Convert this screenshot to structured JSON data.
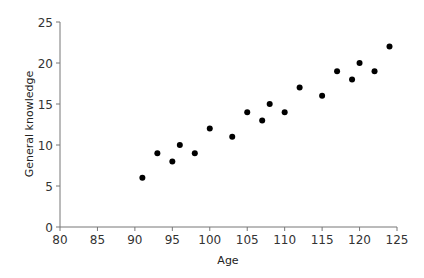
{
  "chart_data": {
    "type": "scatter",
    "title": "",
    "xlabel": "Age",
    "ylabel": "General knowledge",
    "xlim": [
      80,
      125
    ],
    "ylim": [
      0,
      25
    ],
    "xticks": [
      80,
      85,
      90,
      95,
      100,
      105,
      110,
      115,
      120,
      125
    ],
    "yticks": [
      0,
      5,
      10,
      15,
      20,
      25
    ],
    "grid": false,
    "legend": null,
    "marker_color": "#000000",
    "points": [
      {
        "x": 91,
        "y": 6
      },
      {
        "x": 93,
        "y": 9
      },
      {
        "x": 95,
        "y": 8
      },
      {
        "x": 96,
        "y": 10
      },
      {
        "x": 98,
        "y": 9
      },
      {
        "x": 100,
        "y": 12
      },
      {
        "x": 103,
        "y": 11
      },
      {
        "x": 105,
        "y": 14
      },
      {
        "x": 107,
        "y": 13
      },
      {
        "x": 108,
        "y": 15
      },
      {
        "x": 110,
        "y": 14
      },
      {
        "x": 112,
        "y": 17
      },
      {
        "x": 115,
        "y": 16
      },
      {
        "x": 117,
        "y": 19
      },
      {
        "x": 119,
        "y": 18
      },
      {
        "x": 120,
        "y": 20
      },
      {
        "x": 122,
        "y": 19
      },
      {
        "x": 124,
        "y": 22
      }
    ]
  }
}
